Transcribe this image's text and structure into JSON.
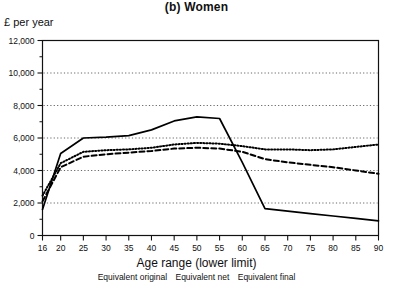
{
  "chart_data": {
    "type": "line",
    "title": "(b) Women",
    "xlabel": "Age range (lower limit)",
    "ylabel": "£ per year",
    "ylim": [
      0,
      12000
    ],
    "xlim": [
      16,
      90
    ],
    "grid": true,
    "legend_position": "below",
    "y_ticks": [
      0,
      2000,
      4000,
      6000,
      8000,
      10000,
      12000
    ],
    "y_tick_labels": [
      "0",
      "2,000",
      "4,000",
      "6,000",
      "8,000",
      "10,000",
      "12,000"
    ],
    "y_minor_step": 1000,
    "x_ticks": [
      16,
      20,
      25,
      30,
      35,
      40,
      45,
      50,
      55,
      60,
      65,
      70,
      75,
      80,
      85,
      90
    ],
    "x_tick_labels": [
      "16",
      "20",
      "25",
      "30",
      "35",
      "40",
      "45",
      "50",
      "55",
      "60",
      "65",
      "70",
      "75",
      "80",
      "85",
      "90"
    ],
    "x": [
      16,
      20,
      25,
      30,
      35,
      40,
      45,
      50,
      55,
      60,
      65,
      70,
      75,
      80,
      85,
      90
    ],
    "series": [
      {
        "name": "Equivalent original",
        "style": "solid",
        "color": "#000000",
        "values": [
          1600,
          5050,
          6000,
          6050,
          6150,
          6500,
          7050,
          7300,
          7200,
          4500,
          1650,
          1500,
          1350,
          1200,
          1050,
          900
        ]
      },
      {
        "name": "Equivalent net",
        "style": "dotted",
        "color": "#000000",
        "values": [
          2450,
          4450,
          5150,
          5250,
          5300,
          5400,
          5600,
          5700,
          5650,
          5500,
          5300,
          5300,
          5250,
          5300,
          5450,
          5600
        ]
      },
      {
        "name": "Equivalent final",
        "style": "dashed",
        "color": "#000000",
        "values": [
          2100,
          4200,
          4850,
          5000,
          5100,
          5200,
          5350,
          5400,
          5350,
          5150,
          4700,
          4500,
          4350,
          4200,
          4000,
          3800
        ]
      }
    ]
  },
  "legend": {
    "items": [
      "Equivalent original",
      "Equivalent net",
      "Equivalent final"
    ]
  }
}
